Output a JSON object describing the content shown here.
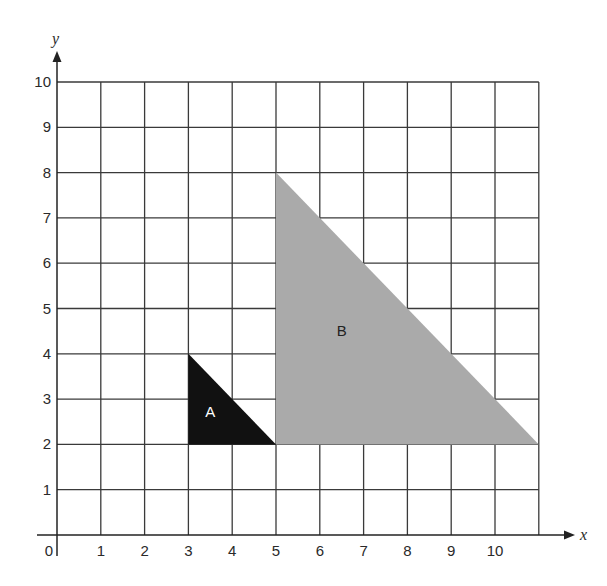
{
  "diagram": {
    "type": "coordinate-grid",
    "x_axis": {
      "label": "x",
      "ticks": [
        "0",
        "1",
        "2",
        "3",
        "4",
        "5",
        "6",
        "7",
        "8",
        "9",
        "10"
      ],
      "grid_max": 11
    },
    "y_axis": {
      "label": "y",
      "ticks": [
        "1",
        "2",
        "3",
        "4",
        "5",
        "6",
        "7",
        "8",
        "9",
        "10"
      ],
      "grid_max": 10
    },
    "shapes": [
      {
        "label": "A",
        "fill": "#111111",
        "label_color": "#ffffff",
        "vertices": [
          [
            3,
            4
          ],
          [
            3,
            2
          ],
          [
            5,
            2
          ]
        ],
        "label_pos": [
          3.5,
          2.6
        ]
      },
      {
        "label": "B",
        "fill": "#aaaaaa",
        "label_color": "#222222",
        "vertices": [
          [
            5,
            8
          ],
          [
            5,
            2
          ],
          [
            11,
            2
          ]
        ],
        "label_pos": [
          6.5,
          4.4
        ]
      }
    ],
    "colors": {
      "grid": "#3a3a3a",
      "axis": "#222222"
    }
  }
}
